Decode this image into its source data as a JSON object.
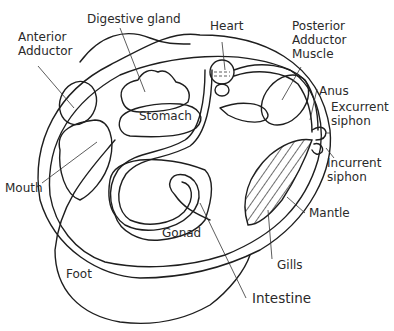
{
  "diagram": {
    "labels": {
      "anterior_adductor": "Anterior\nAdductor",
      "digestive_gland": "Digestive gland",
      "heart": "Heart",
      "posterior_adductor": "Posterior\nAdductor\nMuscle",
      "anus": "Anus",
      "excurrent_siphon": "Excurrent\nsiphon",
      "incurrent_siphon": "Incurrent\nsiphon",
      "stomach": "Stomach",
      "mouth": "Mouth",
      "mantle": "Mantle",
      "gonad": "Gonad",
      "foot": "Foot",
      "gills": "Gills",
      "intestine": "Intestine"
    }
  }
}
